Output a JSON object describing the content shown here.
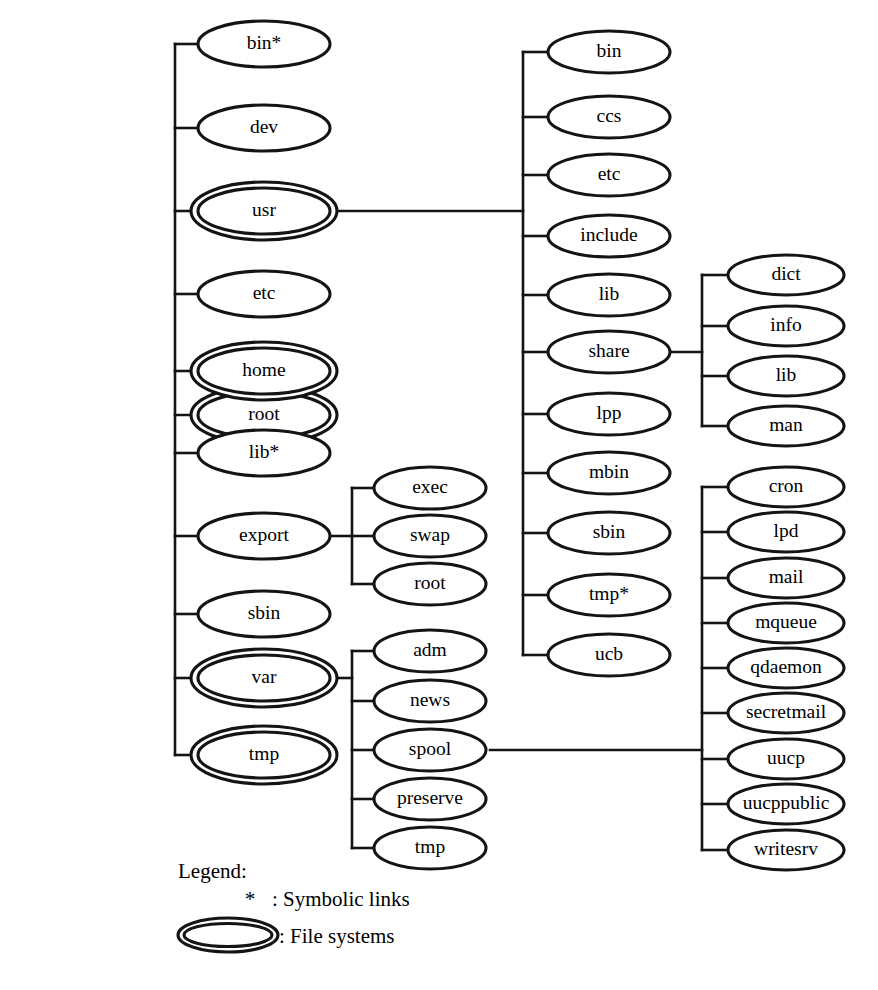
{
  "diagram": {
    "type": "tree",
    "colors": {
      "stroke": "#141414",
      "fill": "#ffffff",
      "background": "#ffffff",
      "text": "#000000"
    },
    "legend": {
      "heading": "Legend:",
      "items": [
        {
          "symbol": "*",
          "symbol_kind": "asterisk",
          "separator": ":",
          "label": "Symbolic links"
        },
        {
          "symbol": "",
          "symbol_kind": "double-ellipse",
          "separator": ":",
          "label": "File systems"
        }
      ]
    },
    "columns": [
      {
        "id": "col-root",
        "name": "root-column",
        "cx": 264,
        "rx": 66,
        "ry": 23,
        "nodes": [
          {
            "id": "root",
            "label": "root",
            "cy": 415,
            "double": true,
            "symlink": false
          }
        ]
      },
      {
        "id": "col-root-children",
        "name": "root-children-column",
        "cx": 264,
        "rx": 66,
        "ry": 23,
        "trunk_x": 175,
        "nodes": [
          {
            "id": "bin",
            "label": "bin*",
            "cy": 44,
            "double": false,
            "symlink": true
          },
          {
            "id": "dev",
            "label": "dev",
            "cy": 128,
            "double": false,
            "symlink": false
          },
          {
            "id": "usr",
            "label": "usr",
            "cy": 211,
            "double": true,
            "symlink": false
          },
          {
            "id": "etc",
            "label": "etc",
            "cy": 294,
            "double": false,
            "symlink": false
          },
          {
            "id": "home",
            "label": "home",
            "cy": 371,
            "double": true,
            "symlink": false
          },
          {
            "id": "lib",
            "label": "lib*",
            "cy": 453,
            "double": false,
            "symlink": true
          },
          {
            "id": "export",
            "label": "export",
            "cy": 536,
            "double": false,
            "symlink": false
          },
          {
            "id": "sbin",
            "label": "sbin",
            "cy": 614,
            "double": false,
            "symlink": false
          },
          {
            "id": "var",
            "label": "var",
            "cy": 678,
            "double": true,
            "symlink": false
          },
          {
            "id": "tmp",
            "label": "tmp",
            "cy": 755,
            "double": true,
            "symlink": false
          }
        ]
      },
      {
        "id": "col-export-children",
        "name": "export-children-column",
        "cx": 430,
        "rx": 56,
        "ry": 21,
        "trunk_x": 352,
        "parent": "export",
        "parent_edge_y": 536,
        "parent_edge_x0": 330,
        "nodes": [
          {
            "id": "exec",
            "label": "exec",
            "cy": 488,
            "double": false,
            "symlink": false
          },
          {
            "id": "swap",
            "label": "swap",
            "cy": 536,
            "double": false,
            "symlink": false
          },
          {
            "id": "exp-root",
            "label": "root",
            "cy": 584,
            "double": false,
            "symlink": false
          }
        ]
      },
      {
        "id": "col-var-children",
        "name": "var-children-column",
        "cx": 430,
        "rx": 56,
        "ry": 21,
        "trunk_x": 352,
        "parent": "var",
        "parent_edge_y": 678,
        "parent_edge_x0": 330,
        "nodes": [
          {
            "id": "adm",
            "label": "adm",
            "cy": 651,
            "double": false,
            "symlink": false
          },
          {
            "id": "news",
            "label": "news",
            "cy": 701,
            "double": false,
            "symlink": false
          },
          {
            "id": "spool",
            "label": "spool",
            "cy": 750,
            "double": false,
            "symlink": false
          },
          {
            "id": "preserve",
            "label": "preserve",
            "cy": 799,
            "double": false,
            "symlink": false
          },
          {
            "id": "var-tmp",
            "label": "tmp",
            "cy": 848,
            "double": false,
            "symlink": false
          }
        ]
      },
      {
        "id": "col-usr-children",
        "name": "usr-children-column",
        "cx": 609,
        "rx": 61,
        "ry": 21,
        "trunk_x": 523,
        "parent": "usr",
        "parent_edge_y": 211,
        "parent_edge_x0": 330,
        "nodes": [
          {
            "id": "usr-bin",
            "label": "bin",
            "cy": 52,
            "double": false,
            "symlink": false
          },
          {
            "id": "usr-ccs",
            "label": "ccs",
            "cy": 117,
            "double": false,
            "symlink": false
          },
          {
            "id": "usr-etc",
            "label": "etc",
            "cy": 175,
            "double": false,
            "symlink": false
          },
          {
            "id": "usr-include",
            "label": "include",
            "cy": 236,
            "double": false,
            "symlink": false
          },
          {
            "id": "usr-lib",
            "label": "lib",
            "cy": 295,
            "double": false,
            "symlink": false
          },
          {
            "id": "usr-share",
            "label": "share",
            "cy": 352,
            "double": false,
            "symlink": false
          },
          {
            "id": "usr-lpp",
            "label": "lpp",
            "cy": 414,
            "double": false,
            "symlink": false
          },
          {
            "id": "usr-mbin",
            "label": "mbin",
            "cy": 473,
            "double": false,
            "symlink": false
          },
          {
            "id": "usr-sbin",
            "label": "sbin",
            "cy": 533,
            "double": false,
            "symlink": false
          },
          {
            "id": "usr-tmp",
            "label": "tmp*",
            "cy": 595,
            "double": false,
            "symlink": true
          },
          {
            "id": "usr-ucb",
            "label": "ucb",
            "cy": 655,
            "double": false,
            "symlink": false
          }
        ]
      },
      {
        "id": "col-share-children",
        "name": "share-children-column",
        "cx": 786,
        "rx": 58,
        "ry": 20,
        "trunk_x": 702,
        "parent": "usr-share",
        "parent_edge_y": 352,
        "parent_edge_x0": 670,
        "nodes": [
          {
            "id": "dict",
            "label": "dict",
            "cy": 275,
            "double": false,
            "symlink": false
          },
          {
            "id": "info",
            "label": "info",
            "cy": 326,
            "double": false,
            "symlink": false
          },
          {
            "id": "share-lib",
            "label": "lib",
            "cy": 376,
            "double": false,
            "symlink": false
          },
          {
            "id": "man",
            "label": "man",
            "cy": 426,
            "double": false,
            "symlink": false
          }
        ]
      },
      {
        "id": "col-spool-children",
        "name": "spool-children-column",
        "cx": 786,
        "rx": 58,
        "ry": 20,
        "trunk_x": 702,
        "parent": "spool",
        "parent_edge_y": 750,
        "parent_edge_x0": 490,
        "nodes": [
          {
            "id": "cron",
            "label": "cron",
            "cy": 487,
            "double": false,
            "symlink": false
          },
          {
            "id": "lpd",
            "label": "lpd",
            "cy": 532,
            "double": false,
            "symlink": false
          },
          {
            "id": "mail",
            "label": "mail",
            "cy": 578,
            "double": false,
            "symlink": false
          },
          {
            "id": "mqueue",
            "label": "mqueue",
            "cy": 623,
            "double": false,
            "symlink": false
          },
          {
            "id": "qdaemon",
            "label": "qdaemon",
            "cy": 668,
            "double": false,
            "symlink": false
          },
          {
            "id": "secretmail",
            "label": "secretmail",
            "cy": 713,
            "double": false,
            "symlink": false
          },
          {
            "id": "uucp",
            "label": "uucp",
            "cy": 759,
            "double": false,
            "symlink": false
          },
          {
            "id": "uucppublic",
            "label": "uucppublic",
            "cy": 804,
            "double": false,
            "symlink": false
          },
          {
            "id": "writesrv",
            "label": "writesrv",
            "cy": 850,
            "double": false,
            "symlink": false
          }
        ]
      }
    ],
    "root_connector": {
      "from_x": 330,
      "to_x": 175,
      "y": 415
    }
  }
}
